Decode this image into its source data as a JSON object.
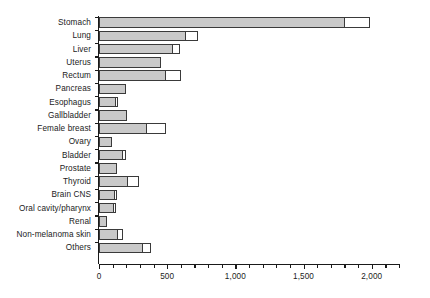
{
  "chart_data": {
    "type": "bar",
    "orientation": "horizontal",
    "stacked": true,
    "title": "",
    "subtitle": "",
    "xlabel": "",
    "ylabel": "",
    "xlim": [
      0,
      2200
    ],
    "ylim": null,
    "grid": false,
    "legend": null,
    "legend_position": "none",
    "xticks": [
      0,
      500,
      1000,
      1500,
      2000
    ],
    "xtick_labels": [
      "0",
      "500",
      "1,000",
      "1,500",
      "2,000"
    ],
    "xtick_minor_step": 100,
    "colors": {
      "segment_1": "#c9c9c9",
      "segment_2": "#ffffff",
      "outline": "#3a3a3a",
      "axis": "#1a1a1a"
    },
    "series": [
      {
        "name": "segment-1-gray",
        "values": [
          1805,
          635,
          540,
          455,
          490,
          200,
          128,
          205,
          355,
          93,
          175,
          130,
          215,
          115,
          110,
          62,
          140,
          325
        ]
      },
      {
        "name": "segment-2-white",
        "values": [
          180,
          90,
          55,
          0,
          110,
          0,
          15,
          0,
          140,
          0,
          22,
          0,
          75,
          15,
          15,
          0,
          35,
          60
        ]
      }
    ],
    "categories": [
      "Stomach",
      "Lung",
      "Liver",
      "Uterus",
      "Rectum",
      "Pancreas",
      "Esophagus",
      "Gallbladder",
      "Female breast",
      "Ovary",
      "Bladder",
      "Prostate",
      "Thyroid",
      "Brain CNS",
      "Oral cavity/pharynx",
      "Renal",
      "Non-melanoma skin",
      "Others"
    ],
    "totals": [
      1985,
      725,
      595,
      455,
      600,
      200,
      143,
      205,
      495,
      93,
      197,
      130,
      290,
      130,
      125,
      62,
      175,
      385
    ]
  }
}
